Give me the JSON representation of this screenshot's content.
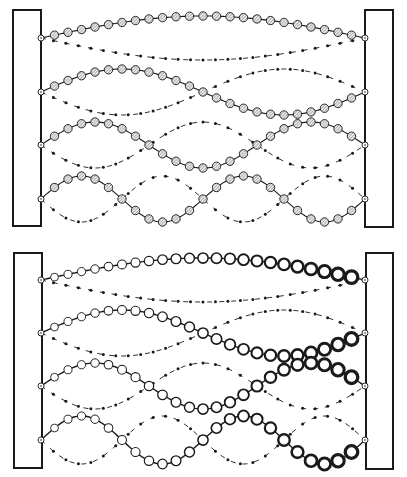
{
  "figure": {
    "colors": {
      "ink": "#1a1a1a",
      "bead_fill_uniform": "#d9d9d9",
      "bead_fill_graded": "#ffffff",
      "background": "#ffffff"
    },
    "panels": [
      {
        "id": "uniform",
        "label": "Uniform beaded string",
        "wall_left": {
          "x": 13,
          "y": 10,
          "w": 28,
          "h": 216
        },
        "wall_right": {
          "x": 365,
          "y": 10,
          "w": 28,
          "h": 217
        },
        "anchor_x_left": 41,
        "anchor_x_right": 365,
        "bead_style": "hatched",
        "modes": [
          {
            "n": 1,
            "baseline_y": 38,
            "amplitude": 22,
            "beads": 23
          },
          {
            "n": 2,
            "baseline_y": 92,
            "amplitude": 23,
            "beads": 23
          },
          {
            "n": 3,
            "baseline_y": 145,
            "amplitude": 23,
            "beads": 23
          },
          {
            "n": 4,
            "baseline_y": 199,
            "amplitude": 23,
            "beads": 23
          }
        ]
      },
      {
        "id": "graded",
        "label": "Graded (increasing mass) beaded string",
        "wall_left": {
          "x": 14,
          "y": 253,
          "w": 28,
          "h": 215
        },
        "wall_right": {
          "x": 366,
          "y": 253,
          "w": 27,
          "h": 216
        },
        "anchor_x_left": 41,
        "anchor_x_right": 365,
        "bead_style": "graded",
        "modes": [
          {
            "n": 1,
            "baseline_y": 280,
            "amplitude": 22,
            "beads": 23
          },
          {
            "n": 2,
            "baseline_y": 333,
            "amplitude": 23,
            "beads": 23
          },
          {
            "n": 3,
            "baseline_y": 386,
            "amplitude": 23,
            "beads": 23
          },
          {
            "n": 4,
            "baseline_y": 440,
            "amplitude": 24,
            "beads": 23
          }
        ]
      }
    ]
  }
}
